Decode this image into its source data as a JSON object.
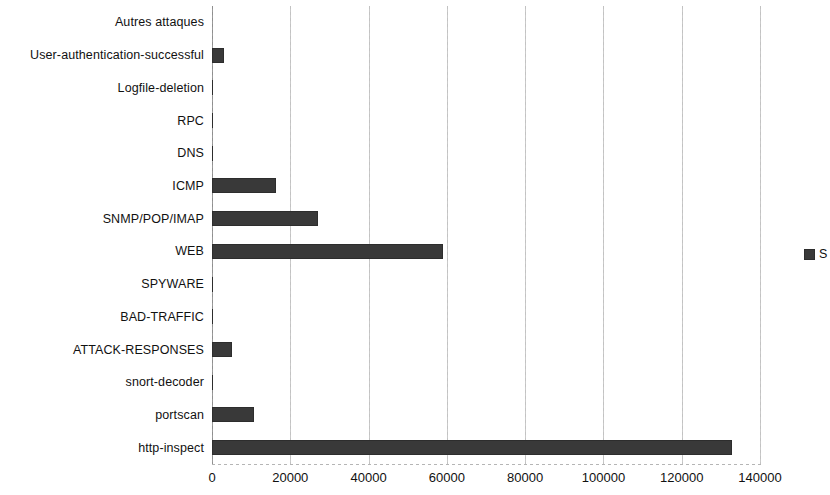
{
  "chart_data": {
    "type": "bar",
    "orientation": "horizontal",
    "title": "",
    "xlabel": "",
    "ylabel": "",
    "xlim": [
      0,
      140000
    ],
    "ylim": null,
    "grid": true,
    "gridlines_axis": "x",
    "legend_position": "right",
    "bar_color": "#393939",
    "categories": [
      "Autres attaques",
      "User-authentication-successful",
      "Logfile-deletion",
      "RPC",
      "DNS",
      "ICMP",
      "SNMP/POP/IMAP",
      "WEB",
      "SPYWARE",
      "BAD-TRAFFIC",
      "ATTACK-RESPONSES",
      "snort-decoder",
      "portscan",
      "http-inspect"
    ],
    "values": [
      0,
      3100,
      250,
      250,
      250,
      16350,
      27100,
      59000,
      300,
      250,
      5100,
      250,
      10700,
      132850
    ],
    "xticks": [
      0,
      20000,
      40000,
      60000,
      80000,
      100000,
      120000,
      140000
    ],
    "xtick_labels": [
      "0",
      "20000",
      "40000",
      "60000",
      "80000",
      "100000",
      "120000",
      "140000"
    ],
    "series": [
      {
        "name": "S",
        "values": [
          0,
          3100,
          250,
          250,
          250,
          16350,
          27100,
          59000,
          300,
          250,
          5100,
          250,
          10700,
          132850
        ]
      }
    ],
    "legend": [
      {
        "label": "S",
        "color": "#393939",
        "truncated": true
      }
    ]
  }
}
